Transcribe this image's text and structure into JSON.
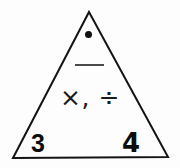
{
  "diagram": {
    "kind": "fact-family-triangle",
    "background_color": "#fdfdfd",
    "stroke_color": "#141414",
    "shape": {
      "name": "triangle",
      "apex": [
        89,
        12
      ],
      "bottom_left": [
        13,
        158
      ],
      "bottom_right": [
        168,
        157
      ],
      "stroke_width": 2
    },
    "apex_marker": {
      "symbol": "•",
      "name": "filled-dot",
      "color": "#111111"
    },
    "fraction_bar": {
      "symbol": "—",
      "name": "horizontal-rule",
      "color": "#4a4a4a"
    },
    "operators": {
      "text": "×, ÷",
      "multiplication": "×",
      "division": "÷",
      "separator": ","
    },
    "corner_values": {
      "left": "3",
      "right": "4"
    }
  }
}
